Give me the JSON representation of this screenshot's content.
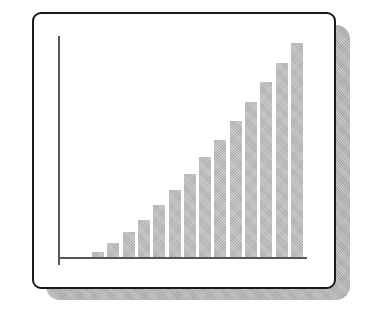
{
  "chart_data": {
    "type": "bar",
    "title": "",
    "xlabel": "",
    "ylabel": "",
    "categories": [
      "1",
      "2",
      "3",
      "4",
      "5",
      "6",
      "7",
      "8",
      "9",
      "10",
      "11",
      "12",
      "13",
      "14"
    ],
    "values": [
      5,
      14,
      25,
      37,
      52,
      67,
      83,
      100,
      117,
      136,
      155,
      175,
      194,
      214
    ],
    "ylim": [
      0,
      221
    ],
    "grid": false,
    "legend": null,
    "bar_color": "#c2c2c2",
    "tick_labels_visible": false
  },
  "layout": {
    "baseline_y": 257,
    "first_bar_x": 92,
    "bar_step": 15.3,
    "bar_width": 12
  }
}
